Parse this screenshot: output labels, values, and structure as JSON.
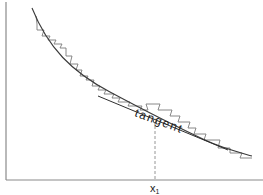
{
  "diagram": {
    "title": "",
    "labels": {
      "tangent": "tangent",
      "x_main": "x",
      "x_sub": "1"
    },
    "elements": [
      "y-axis",
      "x-axis",
      "smooth decreasing curve",
      "staircase (step) approximation of curve",
      "tangent line at point x1",
      "dashed vertical line from tangent point to x-axis"
    ],
    "colors": {
      "axis": "#8a8a8a",
      "curve": "#3a3a3a",
      "stairs": "#7a7a7a",
      "tangent": "#2e2e2e",
      "background": "#ffffff"
    }
  }
}
